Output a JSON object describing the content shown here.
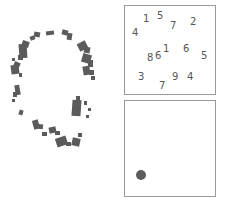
{
  "canvas": {
    "width": 227,
    "height": 206,
    "background": "#ffffff"
  },
  "colors": {
    "ink": "#5b5b5b",
    "digit_text": "#565656",
    "panel_border": "#9a9a9a",
    "panel_fill": "#ffffff"
  },
  "fragment_figure": {
    "label": "fragmented-circle-glyph",
    "description": "degraded outline of a circle composed of disconnected dark gray blobs",
    "blobs": [
      {
        "x": 30,
        "y": 36,
        "w": 5,
        "h": 4,
        "rot": -22
      },
      {
        "x": 34,
        "y": 32,
        "w": 6,
        "h": 5,
        "rot": 10
      },
      {
        "x": 46,
        "y": 31,
        "w": 8,
        "h": 4,
        "rot": -6
      },
      {
        "x": 62,
        "y": 30,
        "w": 6,
        "h": 5,
        "rot": 14
      },
      {
        "x": 67,
        "y": 33,
        "w": 5,
        "h": 7,
        "rot": 8
      },
      {
        "x": 19,
        "y": 44,
        "w": 8,
        "h": 14,
        "rot": -4
      },
      {
        "x": 22,
        "y": 41,
        "w": 7,
        "h": 6,
        "rot": 18
      },
      {
        "x": 18,
        "y": 55,
        "w": 5,
        "h": 5,
        "rot": 0
      },
      {
        "x": 12,
        "y": 58,
        "w": 3,
        "h": 3,
        "rot": 0
      },
      {
        "x": 11,
        "y": 65,
        "w": 8,
        "h": 9,
        "rot": -8
      },
      {
        "x": 14,
        "y": 62,
        "w": 6,
        "h": 5,
        "rot": 24
      },
      {
        "x": 19,
        "y": 73,
        "w": 3,
        "h": 4,
        "rot": 0
      },
      {
        "x": 15,
        "y": 85,
        "w": 5,
        "h": 10,
        "rot": -10
      },
      {
        "x": 13,
        "y": 92,
        "w": 4,
        "h": 5,
        "rot": 0
      },
      {
        "x": 12,
        "y": 99,
        "w": 3,
        "h": 3,
        "rot": 0
      },
      {
        "x": 19,
        "y": 110,
        "w": 4,
        "h": 5,
        "rot": 18
      },
      {
        "x": 33,
        "y": 120,
        "w": 6,
        "h": 9,
        "rot": -16
      },
      {
        "x": 36,
        "y": 124,
        "w": 7,
        "h": 5,
        "rot": 6
      },
      {
        "x": 42,
        "y": 132,
        "w": 5,
        "h": 4,
        "rot": 0
      },
      {
        "x": 49,
        "y": 127,
        "w": 7,
        "h": 6,
        "rot": -12
      },
      {
        "x": 55,
        "y": 131,
        "w": 5,
        "h": 4,
        "rot": 0
      },
      {
        "x": 56,
        "y": 137,
        "w": 11,
        "h": 9,
        "rot": -18
      },
      {
        "x": 66,
        "y": 142,
        "w": 5,
        "h": 4,
        "rot": 0
      },
      {
        "x": 72,
        "y": 138,
        "w": 8,
        "h": 8,
        "rot": 12
      },
      {
        "x": 78,
        "y": 133,
        "w": 4,
        "h": 4,
        "rot": 0
      },
      {
        "x": 72,
        "y": 100,
        "w": 9,
        "h": 16,
        "rot": 4
      },
      {
        "x": 76,
        "y": 96,
        "w": 4,
        "h": 6,
        "rot": 0
      },
      {
        "x": 84,
        "y": 101,
        "w": 3,
        "h": 4,
        "rot": 0
      },
      {
        "x": 88,
        "y": 108,
        "w": 3,
        "h": 3,
        "rot": 0
      },
      {
        "x": 86,
        "y": 115,
        "w": 3,
        "h": 3,
        "rot": 0
      },
      {
        "x": 78,
        "y": 42,
        "w": 9,
        "h": 8,
        "rot": -28
      },
      {
        "x": 84,
        "y": 47,
        "w": 6,
        "h": 6,
        "rot": 10
      },
      {
        "x": 82,
        "y": 54,
        "w": 9,
        "h": 9,
        "rot": 16
      },
      {
        "x": 88,
        "y": 60,
        "w": 5,
        "h": 7,
        "rot": 0
      },
      {
        "x": 83,
        "y": 66,
        "w": 7,
        "h": 9,
        "rot": -10
      },
      {
        "x": 89,
        "y": 70,
        "w": 5,
        "h": 5,
        "rot": 0
      },
      {
        "x": 91,
        "y": 76,
        "w": 4,
        "h": 4,
        "rot": 0
      }
    ]
  },
  "digits_panel": {
    "name": "digits-panel",
    "items": [
      {
        "value": "1",
        "x": 18,
        "y": 8
      },
      {
        "value": "5",
        "x": 32,
        "y": 5
      },
      {
        "value": "7",
        "x": 45,
        "y": 15
      },
      {
        "value": "2",
        "x": 65,
        "y": 11
      },
      {
        "value": "4",
        "x": 7,
        "y": 22
      },
      {
        "value": "1",
        "x": 38,
        "y": 38
      },
      {
        "value": "6",
        "x": 58,
        "y": 38
      },
      {
        "value": "5",
        "x": 76,
        "y": 45
      },
      {
        "value": "8",
        "x": 22,
        "y": 47
      },
      {
        "value": "6",
        "x": 30,
        "y": 45
      },
      {
        "value": "3",
        "x": 13,
        "y": 66
      },
      {
        "value": "9",
        "x": 47,
        "y": 66
      },
      {
        "value": "4",
        "x": 62,
        "y": 66
      },
      {
        "value": "7",
        "x": 34,
        "y": 75
      }
    ]
  },
  "dot_panel": {
    "name": "dot-panel",
    "dot": {
      "x": 11,
      "y": 69,
      "d": 10
    }
  }
}
